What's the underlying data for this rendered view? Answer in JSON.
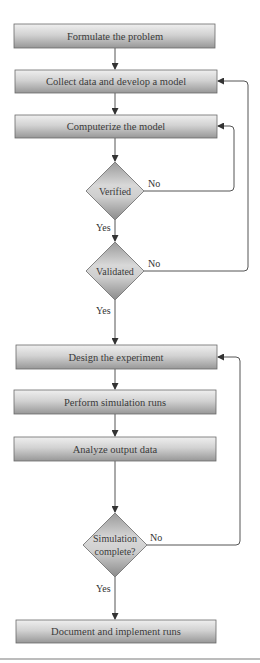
{
  "diagram": {
    "type": "flowchart",
    "title": "",
    "nodes": [
      {
        "id": "formulate",
        "shape": "process",
        "label": "Formulate the problem"
      },
      {
        "id": "collect",
        "shape": "process",
        "label": "Collect data and develop a model"
      },
      {
        "id": "computerize",
        "shape": "process",
        "label": "Computerize the model"
      },
      {
        "id": "verified",
        "shape": "decision",
        "label": "Verified"
      },
      {
        "id": "validated",
        "shape": "decision",
        "label": "Validated"
      },
      {
        "id": "design",
        "shape": "process",
        "label": "Design the experiment"
      },
      {
        "id": "perform",
        "shape": "process",
        "label": "Perform simulation runs"
      },
      {
        "id": "analyze",
        "shape": "process",
        "label": "Analyze output data"
      },
      {
        "id": "complete",
        "shape": "decision",
        "label_line1": "Simulation",
        "label_line2": "complete?"
      },
      {
        "id": "document",
        "shape": "process",
        "label": "Document and implement runs"
      }
    ],
    "edges": [
      {
        "from": "formulate",
        "to": "collect",
        "label": ""
      },
      {
        "from": "collect",
        "to": "computerize",
        "label": ""
      },
      {
        "from": "computerize",
        "to": "verified",
        "label": ""
      },
      {
        "from": "verified",
        "to": "validated",
        "label": "Yes"
      },
      {
        "from": "verified",
        "to": "computerize",
        "label": "No"
      },
      {
        "from": "validated",
        "to": "design",
        "label": "Yes"
      },
      {
        "from": "validated",
        "to": "collect",
        "label": "No"
      },
      {
        "from": "design",
        "to": "perform",
        "label": ""
      },
      {
        "from": "perform",
        "to": "analyze",
        "label": ""
      },
      {
        "from": "analyze",
        "to": "complete",
        "label": ""
      },
      {
        "from": "complete",
        "to": "document",
        "label": "Yes"
      },
      {
        "from": "complete",
        "to": "design",
        "label": "No"
      }
    ],
    "edge_labels": {
      "verified_yes": "Yes",
      "verified_no": "No",
      "validated_yes": "Yes",
      "validated_no": "No",
      "complete_yes": "Yes",
      "complete_no": "No"
    },
    "colors": {
      "box_top": "#ececec",
      "box_bottom": "#9c9c9c",
      "diamond_light": "#dcdcdc",
      "diamond_dark": "#8e8e8e",
      "line": "#555555",
      "text": "#3a3a3a"
    }
  }
}
